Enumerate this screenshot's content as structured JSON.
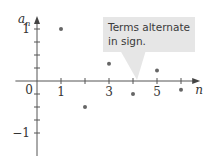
{
  "chart_data": {
    "type": "scatter",
    "title": "",
    "xlabel": "n",
    "ylabel": "a_n",
    "ylabel_main": "a",
    "ylabel_sub": "n",
    "origin_label": "0",
    "x": [
      1,
      2,
      3,
      4,
      5,
      6
    ],
    "y": [
      1,
      -0.5,
      0.3333,
      -0.25,
      0.2,
      -0.1667
    ],
    "xlim": [
      -0.9,
      6.8
    ],
    "ylim": [
      -1.45,
      1.25
    ],
    "x_ticks": [
      1,
      2,
      3,
      4,
      5,
      6
    ],
    "x_tick_labels": [
      {
        "value": 1,
        "label": "1"
      },
      {
        "value": 3,
        "label": "3"
      },
      {
        "value": 5,
        "label": "5"
      }
    ],
    "y_ticks": [
      -1,
      -0.75,
      -0.5,
      -0.25,
      0.25,
      0.5,
      0.75,
      1
    ],
    "y_tick_labels": [
      {
        "value": 1,
        "label": "1"
      },
      {
        "value": -1,
        "label": "−1"
      }
    ],
    "grid": false,
    "annotations": [
      {
        "text_lines": [
          "Terms alternate",
          "in sign."
        ],
        "points_to": {
          "x": 4,
          "y": 0
        }
      }
    ],
    "colors": {
      "axis": "#555555",
      "point": "#666666",
      "callout_fill": "#e6e6e6"
    }
  }
}
